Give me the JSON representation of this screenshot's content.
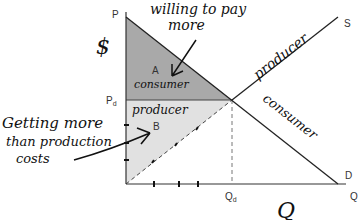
{
  "diagram": {
    "type": "supply-demand-surplus",
    "axes": {
      "y_label": "P",
      "y_marker": "$",
      "x_label": "Q",
      "x_handwritten": "Q"
    },
    "curves": {
      "supply": {
        "label": "S",
        "annotation": "producer"
      },
      "demand": {
        "label": "D",
        "annotation": "consumer"
      }
    },
    "equilibrium": {
      "price_label": "P",
      "price_sub": "d",
      "quantity_label": "Q",
      "quantity_sub": "d"
    },
    "regions": {
      "a": {
        "letter": "A",
        "caption": "consumer",
        "color": "#a9a9a9"
      },
      "b": {
        "letter": "B",
        "caption": "producer",
        "color": "#e1e1e1"
      }
    },
    "notes": {
      "top_line1": "willing to pay",
      "top_line2": "more",
      "left_line1": "Getting more",
      "left_line2": "than production",
      "left_line3": "costs"
    }
  }
}
